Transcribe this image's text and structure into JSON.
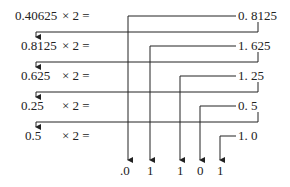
{
  "rows": [
    {
      "operand": "0.40625",
      "op": "× 2 =",
      "result": "0. 8125"
    },
    {
      "operand": "0.8125",
      "op": "× 2 =",
      "result": "1. 625"
    },
    {
      "operand": "0.625",
      "op": "× 2 =",
      "result": "1. 25"
    },
    {
      "operand": "0.25",
      "op": "× 2 =",
      "result": "0. 5"
    },
    {
      "operand": "0.5",
      "op": "× 2 =",
      "result": "1. 0"
    }
  ],
  "bits": [
    ".0",
    "1",
    "1",
    "0",
    "1"
  ],
  "colors": {
    "line": "#222222",
    "text": "#222222"
  }
}
